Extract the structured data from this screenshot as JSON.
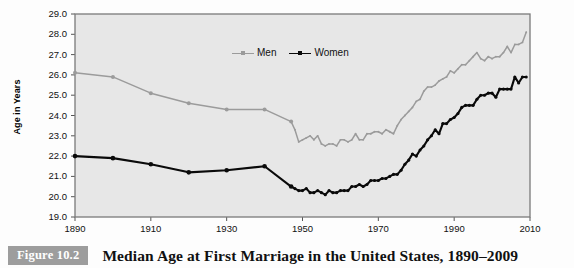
{
  "figure": {
    "tag": "Figure 10.2",
    "caption": "Median Age at First Marriage in the United States, 1890–2009"
  },
  "axes": {
    "y_title": "Age in Years",
    "y_ticks": [
      "29.0",
      "28.0",
      "27.0",
      "26.0",
      "25.0",
      "24.0",
      "23.0",
      "22.0",
      "21.0",
      "20.0",
      "19.0"
    ],
    "x_ticks": [
      "1890",
      "1910",
      "1930",
      "1950",
      "1970",
      "1990",
      "2010"
    ]
  },
  "legend": {
    "items": [
      {
        "label": "Men",
        "color": "#9b9b9b"
      },
      {
        "label": "Women",
        "color": "#0a0a0a"
      }
    ]
  },
  "colors": {
    "plot_background": "#e7e7e7",
    "plot_border": "#7a7a7a",
    "men_line": "#9b9b9b",
    "women_line": "#0a0a0a",
    "figure_tag_background": "#9d9d9d"
  },
  "chart_data": {
    "type": "line",
    "title": "Median Age at First Marriage in the United States, 1890–2009",
    "xlabel": "",
    "ylabel": "Age in Years",
    "xlim": [
      1890,
      2010
    ],
    "ylim": [
      19.0,
      29.0
    ],
    "ytick_step": 1.0,
    "xtick_step": 20,
    "grid": false,
    "legend_position": "top-center",
    "markers": "square/diamond on decadal points 1890-1947; dot markers on annual points",
    "series": [
      {
        "name": "Men",
        "color": "#9b9b9b",
        "x": [
          1890,
          1900,
          1910,
          1920,
          1930,
          1940,
          1947,
          1948,
          1949,
          1950,
          1951,
          1952,
          1953,
          1954,
          1955,
          1956,
          1957,
          1958,
          1959,
          1960,
          1961,
          1962,
          1963,
          1964,
          1965,
          1966,
          1967,
          1968,
          1969,
          1970,
          1971,
          1972,
          1973,
          1974,
          1975,
          1976,
          1977,
          1978,
          1979,
          1980,
          1981,
          1982,
          1983,
          1984,
          1985,
          1986,
          1987,
          1988,
          1989,
          1990,
          1991,
          1992,
          1993,
          1994,
          1995,
          1996,
          1997,
          1998,
          1999,
          2000,
          2001,
          2002,
          2003,
          2004,
          2005,
          2006,
          2007,
          2008,
          2009
        ],
        "values": [
          26.1,
          25.9,
          25.1,
          24.6,
          24.3,
          24.3,
          23.7,
          23.3,
          22.7,
          22.8,
          22.9,
          23.0,
          22.8,
          23.0,
          22.6,
          22.5,
          22.6,
          22.6,
          22.5,
          22.8,
          22.8,
          22.7,
          22.8,
          23.1,
          22.8,
          22.8,
          23.1,
          23.1,
          23.2,
          23.2,
          23.1,
          23.3,
          23.2,
          23.1,
          23.5,
          23.8,
          24.0,
          24.2,
          24.4,
          24.7,
          24.8,
          25.2,
          25.4,
          25.4,
          25.5,
          25.7,
          25.8,
          25.9,
          26.2,
          26.1,
          26.3,
          26.5,
          26.5,
          26.7,
          26.9,
          27.1,
          26.8,
          26.7,
          26.9,
          26.8,
          26.9,
          26.9,
          27.1,
          27.4,
          27.1,
          27.5,
          27.5,
          27.6,
          28.1
        ]
      },
      {
        "name": "Women",
        "color": "#0a0a0a",
        "x": [
          1890,
          1900,
          1910,
          1920,
          1930,
          1940,
          1947,
          1948,
          1949,
          1950,
          1951,
          1952,
          1953,
          1954,
          1955,
          1956,
          1957,
          1958,
          1959,
          1960,
          1961,
          1962,
          1963,
          1964,
          1965,
          1966,
          1967,
          1968,
          1969,
          1970,
          1971,
          1972,
          1973,
          1974,
          1975,
          1976,
          1977,
          1978,
          1979,
          1980,
          1981,
          1982,
          1983,
          1984,
          1985,
          1986,
          1987,
          1988,
          1989,
          1990,
          1991,
          1992,
          1993,
          1994,
          1995,
          1996,
          1997,
          1998,
          1999,
          2000,
          2001,
          2002,
          2003,
          2004,
          2005,
          2006,
          2007,
          2008,
          2009
        ],
        "values": [
          22.0,
          21.9,
          21.6,
          21.2,
          21.3,
          21.5,
          20.5,
          20.4,
          20.3,
          20.3,
          20.4,
          20.2,
          20.2,
          20.3,
          20.2,
          20.1,
          20.3,
          20.2,
          20.2,
          20.3,
          20.3,
          20.3,
          20.5,
          20.5,
          20.6,
          20.5,
          20.6,
          20.8,
          20.8,
          20.8,
          20.9,
          20.9,
          21.0,
          21.1,
          21.1,
          21.3,
          21.6,
          21.8,
          22.1,
          22.0,
          22.3,
          22.5,
          22.8,
          23.0,
          23.3,
          23.1,
          23.6,
          23.6,
          23.8,
          23.9,
          24.1,
          24.4,
          24.5,
          24.5,
          24.5,
          24.8,
          25.0,
          25.0,
          25.1,
          25.1,
          24.9,
          25.3,
          25.3,
          25.3,
          25.3,
          25.9,
          25.6,
          25.9,
          25.9
        ]
      }
    ]
  }
}
